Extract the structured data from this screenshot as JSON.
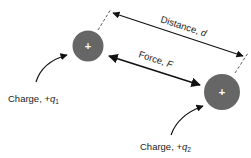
{
  "diagram": {
    "type": "coulombs-law",
    "colors": {
      "charge_fill": "#666666",
      "charge_sign": "#ffffff",
      "line": "#111111",
      "text": "#222222",
      "background": "#ffffff"
    },
    "charges": [
      {
        "id": "q1",
        "sign": "+",
        "label_prefix": "Charge, +",
        "symbol": "q",
        "subscript": "1"
      },
      {
        "id": "q2",
        "sign": "+",
        "label_prefix": "Charge, +",
        "symbol": "q",
        "subscript": "2"
      }
    ],
    "distance": {
      "label_prefix": "Distance, ",
      "symbol": "d"
    },
    "force": {
      "label_prefix": "Force, ",
      "symbol": "F"
    }
  }
}
